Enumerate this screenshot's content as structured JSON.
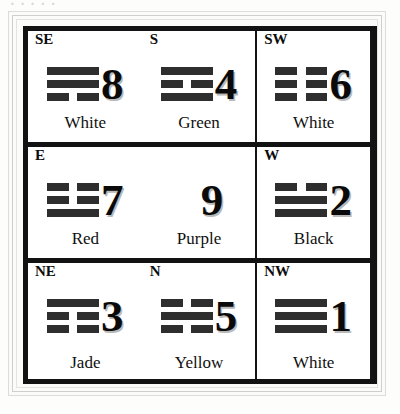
{
  "title_remnant": "· · · · ·",
  "chart_data": {
    "type": "table",
    "columns": [
      "direction",
      "number",
      "color",
      "trigram"
    ],
    "rows": [
      {
        "direction": "SE",
        "number": "8",
        "color": "White",
        "trigram": [
          "solid",
          "solid",
          "broken"
        ]
      },
      {
        "direction": "S",
        "number": "4",
        "color": "Green",
        "trigram": [
          "solid",
          "broken",
          "solid"
        ]
      },
      {
        "direction": "SW",
        "number": "6",
        "color": "White",
        "trigram": [
          "broken",
          "broken",
          "broken"
        ]
      },
      {
        "direction": "E",
        "number": "7",
        "color": "Red",
        "trigram": [
          "broken",
          "broken",
          "solid"
        ]
      },
      {
        "direction": "",
        "number": "9",
        "color": "Purple",
        "trigram": []
      },
      {
        "direction": "W",
        "number": "2",
        "color": "Black",
        "trigram": [
          "broken",
          "solid",
          "solid"
        ]
      },
      {
        "direction": "NE",
        "number": "3",
        "color": "Jade",
        "trigram": [
          "solid",
          "broken",
          "broken"
        ]
      },
      {
        "direction": "N",
        "number": "5",
        "color": "Yellow",
        "trigram": [
          "broken",
          "solid",
          "broken"
        ]
      },
      {
        "direction": "NW",
        "number": "1",
        "color": "White",
        "trigram": [
          "solid",
          "solid",
          "solid"
        ]
      }
    ]
  },
  "cells": [
    {
      "direction": "SE",
      "number": "8",
      "color": "White"
    },
    {
      "direction": "S",
      "number": "4",
      "color": "Green"
    },
    {
      "direction": "SW",
      "number": "6",
      "color": "White"
    },
    {
      "direction": "E",
      "number": "7",
      "color": "Red"
    },
    {
      "direction": "",
      "number": "9",
      "color": "Purple"
    },
    {
      "direction": "W",
      "number": "2",
      "color": "Black"
    },
    {
      "direction": "NE",
      "number": "3",
      "color": "Jade"
    },
    {
      "direction": "N",
      "number": "5",
      "color": "Yellow"
    },
    {
      "direction": "NW",
      "number": "1",
      "color": "White"
    }
  ],
  "colors": {
    "ink": "#121212",
    "bar": "#2e2e2e",
    "page": "#fdfdfb",
    "cell_bg": "#ffffff",
    "shadow": "#b9b9b9"
  }
}
